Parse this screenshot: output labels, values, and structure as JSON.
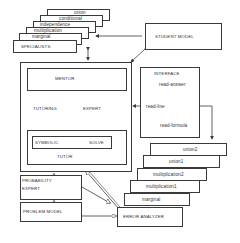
{
  "specialists": {
    "title": "SPECIALISTS",
    "stack": [
      "union",
      "conditional",
      "independence",
      "multiplication",
      "marginal"
    ]
  },
  "student_model": {
    "title": "STUDENT MODEL"
  },
  "tutor": {
    "mentor": "MENTOR",
    "tutoring": "TUTORING",
    "expert": "EXPERT",
    "symbolic": "SYMBOLIC",
    "solve": "SOLVE",
    "title": "TUTOR"
  },
  "interface": {
    "title": "INTERFACE",
    "items": [
      "read-answer",
      "read-line",
      "read-formula"
    ]
  },
  "probability_expert": {
    "title_line1": "PROBABILITY",
    "title_line2": "EXPERT"
  },
  "problem_model": {
    "title": "PROBLEM MODEL"
  },
  "error_analyzer": {
    "title": "ERROR ANALYZER",
    "stack": [
      "union2",
      "union1",
      "multiplication2",
      "multiplication1",
      "marginal"
    ]
  },
  "colors": {
    "line": "#3a3a3a",
    "background": "#ffffff"
  }
}
